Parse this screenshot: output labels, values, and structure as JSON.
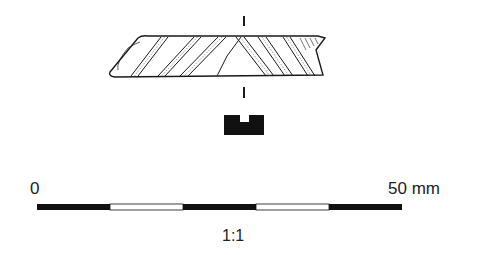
{
  "drawing": {
    "subject": "fragment with diagonal incised bands, plan view and cross-section profile",
    "ink_color": "#1a1a1a",
    "paper_color": "#ffffff"
  },
  "scale_bar": {
    "start_label": "0",
    "end_label": "50 mm",
    "ratio_label": "1:1",
    "segments": [
      "black",
      "white",
      "black",
      "white",
      "black"
    ]
  }
}
